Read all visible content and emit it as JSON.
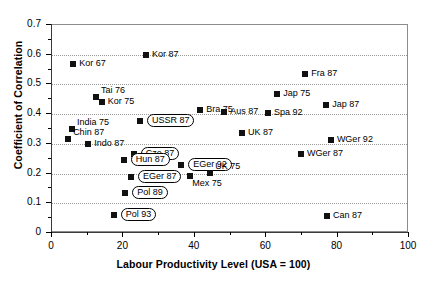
{
  "chart_data": {
    "type": "scatter",
    "title": "",
    "xlabel": "Labour Productivity Level (USA = 100)",
    "ylabel": "Coefficient of Correlation",
    "xlim": [
      0,
      100
    ],
    "ylim": [
      0,
      0.7
    ],
    "xticks": [
      "0",
      "20",
      "40",
      "60",
      "80",
      "100"
    ],
    "xtick_values": [
      0,
      20,
      40,
      60,
      80,
      100
    ],
    "xtick_minor_values": [
      10,
      30,
      50,
      70,
      90
    ],
    "yticks": [
      "0",
      "0.1",
      "0.2",
      "0.3",
      "0.4",
      "0.5",
      "0.6",
      "0.7"
    ],
    "ytick_values": [
      0,
      0.1,
      0.2,
      0.3,
      0.4,
      0.5,
      0.6,
      0.7
    ],
    "ytick_minor_values": [
      0.05,
      0.15,
      0.25,
      0.35,
      0.45,
      0.55,
      0.65
    ],
    "grid": "horizontal-dotted",
    "legend": "none",
    "marker": "filled-square",
    "marker_color": "#111111",
    "points": [
      {
        "label": "Kor 67",
        "x": 6.2,
        "y": 0.567,
        "label_pos": "right",
        "boxed": false
      },
      {
        "label": "Kor 87",
        "x": 26.6,
        "y": 0.596,
        "label_pos": "right",
        "boxed": false
      },
      {
        "label": "Tai 76",
        "x": 12.6,
        "y": 0.455,
        "label_pos": "right-up",
        "boxed": false
      },
      {
        "label": "Kor 75",
        "x": 14.2,
        "y": 0.437,
        "label_pos": "right",
        "boxed": false
      },
      {
        "label": "Bra 75",
        "x": 41.8,
        "y": 0.412,
        "label_pos": "right",
        "boxed": false
      },
      {
        "label": "Fra 87",
        "x": 71.2,
        "y": 0.531,
        "label_pos": "right",
        "boxed": false
      },
      {
        "label": "Jap 75",
        "x": 63.4,
        "y": 0.463,
        "label_pos": "right",
        "boxed": false
      },
      {
        "label": "Jap 87",
        "x": 77.1,
        "y": 0.426,
        "label_pos": "right",
        "boxed": false
      },
      {
        "label": "Spa 92",
        "x": 60.8,
        "y": 0.4,
        "label_pos": "right",
        "boxed": false
      },
      {
        "label": "Aus 87",
        "x": 48.5,
        "y": 0.403,
        "label_pos": "right",
        "boxed": false
      },
      {
        "label": "USSR 87",
        "x": 24.9,
        "y": 0.373,
        "label_pos": "right",
        "boxed": true
      },
      {
        "label": "India 75",
        "x": 5.9,
        "y": 0.345,
        "label_pos": "right-up",
        "boxed": false
      },
      {
        "label": "Chin 87",
        "x": 4.8,
        "y": 0.312,
        "label_pos": "right-up2",
        "boxed": false
      },
      {
        "label": "UK 87",
        "x": 53.5,
        "y": 0.332,
        "label_pos": "right",
        "boxed": false
      },
      {
        "label": "WGer 92",
        "x": 78.4,
        "y": 0.309,
        "label_pos": "right",
        "boxed": false
      },
      {
        "label": "Indo 87",
        "x": 10.4,
        "y": 0.296,
        "label_pos": "right",
        "boxed": false
      },
      {
        "label": "Cze 87",
        "x": 23.2,
        "y": 0.263,
        "label_pos": "right",
        "boxed": true
      },
      {
        "label": "Hun 87",
        "x": 20.4,
        "y": 0.242,
        "label_pos": "right",
        "boxed": true
      },
      {
        "label": "EGer 92",
        "x": 36.5,
        "y": 0.227,
        "label_pos": "right",
        "boxed": true
      },
      {
        "label": "WGer 87",
        "x": 70.0,
        "y": 0.262,
        "label_pos": "right",
        "boxed": false
      },
      {
        "label": "EGer 87",
        "x": 22.4,
        "y": 0.184,
        "label_pos": "right",
        "boxed": true
      },
      {
        "label": "Mex 75",
        "x": 39.0,
        "y": 0.19,
        "label_pos": "right-dn",
        "boxed": false
      },
      {
        "label": "UK 75",
        "x": 44.6,
        "y": 0.197,
        "label_pos": "right-up",
        "boxed": false
      },
      {
        "label": "Pol 89",
        "x": 20.8,
        "y": 0.13,
        "label_pos": "right",
        "boxed": true
      },
      {
        "label": "Pol 93",
        "x": 17.6,
        "y": 0.056,
        "label_pos": "right",
        "boxed": true
      },
      {
        "label": "Can 87",
        "x": 77.3,
        "y": 0.053,
        "label_pos": "right",
        "boxed": false
      }
    ]
  }
}
